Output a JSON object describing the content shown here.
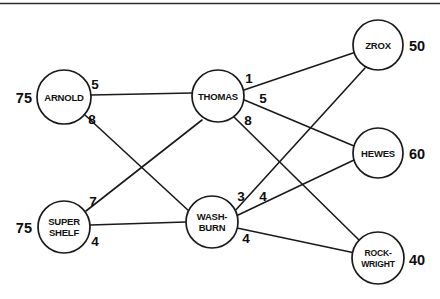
{
  "diagram": {
    "type": "transportation-network",
    "title": "",
    "frame": {
      "top_rule": true
    },
    "nodes": [
      {
        "id": "arnold",
        "label_lines": [
          "ARNOLD"
        ],
        "cx": 64,
        "cy": 97,
        "r": 27,
        "column": "supply"
      },
      {
        "id": "supershelf",
        "label_lines": [
          "SUPER",
          "SHELF"
        ],
        "cx": 64,
        "cy": 227,
        "r": 26,
        "column": "supply"
      },
      {
        "id": "thomas",
        "label_lines": [
          "THOMAS"
        ],
        "cx": 218,
        "cy": 96,
        "r": 26,
        "column": "transship"
      },
      {
        "id": "washburn",
        "label_lines": [
          "WASH-",
          "BURN"
        ],
        "cx": 212,
        "cy": 222,
        "r": 26,
        "column": "transship"
      },
      {
        "id": "zrox",
        "label_lines": [
          "ZROX"
        ],
        "cx": 378,
        "cy": 45,
        "r": 25,
        "column": "demand"
      },
      {
        "id": "hewes",
        "label_lines": [
          "HEWES"
        ],
        "cx": 378,
        "cy": 153,
        "r": 25,
        "column": "demand"
      },
      {
        "id": "rockwright",
        "label_lines": [
          "ROCK-",
          "WRIGHT"
        ],
        "cx": 378,
        "cy": 258,
        "r": 26,
        "column": "demand"
      }
    ],
    "edges": [
      {
        "id": "arnold-thomas",
        "from": "arnold",
        "to": "thomas",
        "weight": "5",
        "label_x": 95,
        "label_y": 89
      },
      {
        "id": "arnold-washburn",
        "from": "arnold",
        "to": "washburn",
        "weight": "8",
        "label_x": 92,
        "label_y": 124
      },
      {
        "id": "supershelf-thomas",
        "from": "supershelf",
        "to": "thomas",
        "weight": "7",
        "label_x": 93,
        "label_y": 206
      },
      {
        "id": "supershelf-washburn",
        "from": "supershelf",
        "to": "washburn",
        "weight": "4",
        "label_x": 95,
        "label_y": 246
      },
      {
        "id": "thomas-zrox",
        "from": "thomas",
        "to": "zrox",
        "weight": "1",
        "label_x": 249,
        "label_y": 83
      },
      {
        "id": "thomas-hewes",
        "from": "thomas",
        "to": "hewes",
        "weight": "5",
        "label_x": 263,
        "label_y": 103
      },
      {
        "id": "thomas-rockwright",
        "from": "thomas",
        "to": "rockwright",
        "weight": "8",
        "label_x": 248,
        "label_y": 125
      },
      {
        "id": "washburn-zrox",
        "from": "washburn",
        "to": "zrox",
        "weight": "3",
        "label_x": 241,
        "label_y": 201
      },
      {
        "id": "washburn-hewes",
        "from": "washburn",
        "to": "hewes",
        "weight": "4",
        "label_x": 263,
        "label_y": 201
      },
      {
        "id": "washburn-rockwright",
        "from": "washburn",
        "to": "rockwright",
        "weight": "4",
        "label_x": 246,
        "label_y": 243
      }
    ],
    "endpoint_values": [
      {
        "id": "arnold-supply",
        "node": "arnold",
        "value": "75",
        "side": "left",
        "x": 32,
        "y": 103
      },
      {
        "id": "supershelf-supply",
        "node": "supershelf",
        "value": "75",
        "side": "left",
        "x": 32,
        "y": 233
      },
      {
        "id": "zrox-demand",
        "node": "zrox",
        "value": "50",
        "side": "right",
        "x": 409,
        "y": 51
      },
      {
        "id": "hewes-demand",
        "node": "hewes",
        "value": "60",
        "side": "right",
        "x": 409,
        "y": 159
      },
      {
        "id": "rockwright-demand",
        "node": "rockwright",
        "value": "40",
        "side": "right",
        "x": 409,
        "y": 265
      }
    ],
    "colors": {
      "stroke": "#1a1a1a",
      "text": "#0d0d0d",
      "background": "#ffffff"
    }
  }
}
